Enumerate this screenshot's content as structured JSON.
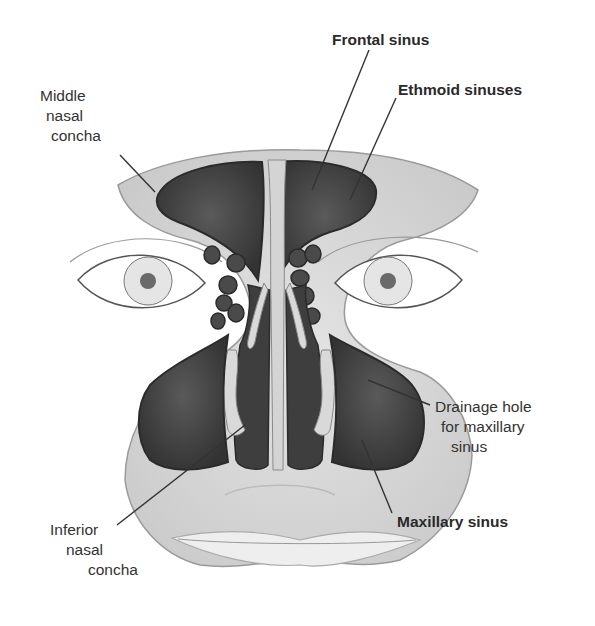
{
  "diagram": {
    "labels": {
      "frontal_sinus": "Frontal sinus",
      "ethmoid_sinuses": "Ethmoid sinuses",
      "middle_nasal_concha": [
        "Middle",
        "nasal",
        "concha"
      ],
      "drainage_hole": [
        "Drainage hole",
        "for maxillary",
        "sinus"
      ],
      "maxillary_sinus": "Maxillary sinus",
      "inferior_nasal_concha": [
        "Inferior",
        "nasal",
        "concha"
      ]
    },
    "colors": {
      "bone": "#d8d8d8",
      "sinus": "#4a4a4a",
      "sinus_edge": "#2b2b2b",
      "text": "#333333",
      "leader": "#333333"
    }
  }
}
